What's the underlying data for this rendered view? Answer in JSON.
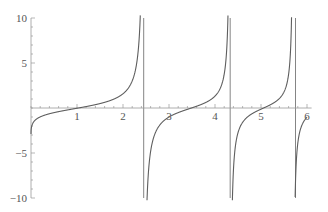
{
  "chart_data": {
    "type": "line",
    "title": "",
    "xlabel": "",
    "ylabel": "",
    "xlim": [
      0,
      6.1
    ],
    "ylim": [
      -10,
      10
    ],
    "grid": false,
    "legend": null,
    "x_ticks": [
      1,
      2,
      3,
      4,
      5,
      6
    ],
    "x_tick_labels": [
      "1",
      "2",
      "3",
      "4",
      "5",
      "6"
    ],
    "y_ticks": [
      -10,
      -5,
      5,
      10
    ],
    "y_tick_labels": [
      "−10",
      "−5",
      "5",
      "10"
    ],
    "x_minor_per_major": 4,
    "y_minor_per_major": 4,
    "series": [
      {
        "name": "f(x)",
        "style": "line",
        "color": "#5e5e5e",
        "description": "tangent-like periodic curve with increasing frequency",
        "vertical_asymptotes": [
          2.45,
          4.33,
          5.75
        ],
        "zero_crossings": [
          1.4,
          3.45,
          5.0
        ],
        "points": [
          [
            0.0,
            -2.9
          ],
          [
            0.1,
            -2.3
          ],
          [
            0.25,
            -1.9
          ],
          [
            0.5,
            -1.45
          ],
          [
            0.75,
            -1.1
          ],
          [
            1.0,
            -0.8
          ],
          [
            1.25,
            -0.45
          ],
          [
            1.5,
            0.0
          ],
          [
            1.75,
            0.5
          ],
          [
            2.0,
            1.3
          ],
          [
            2.2,
            2.6
          ],
          [
            2.3,
            4.0
          ],
          [
            2.38,
            6.5
          ],
          [
            2.42,
            10.0
          ],
          [
            2.48,
            -10.0
          ],
          [
            2.6,
            -6.0
          ],
          [
            2.8,
            -3.3
          ],
          [
            3.0,
            -1.9
          ],
          [
            3.2,
            -1.0
          ],
          [
            3.45,
            0.0
          ],
          [
            3.7,
            1.0
          ],
          [
            3.9,
            2.2
          ],
          [
            4.1,
            4.5
          ],
          [
            4.22,
            7.5
          ],
          [
            4.3,
            10.0
          ],
          [
            4.37,
            -10.0
          ],
          [
            4.5,
            -5.0
          ],
          [
            4.7,
            -2.2
          ],
          [
            5.0,
            0.0
          ],
          [
            5.25,
            1.8
          ],
          [
            5.45,
            4.0
          ],
          [
            5.6,
            7.0
          ],
          [
            5.7,
            10.0
          ],
          [
            5.8,
            -10.0
          ],
          [
            5.9,
            -5.5
          ],
          [
            6.0,
            -3.5
          ]
        ]
      }
    ],
    "plot_params": {
      "phase_offset": -1.238,
      "sqrt_coef": 1.006,
      "sq_coef": 0.2057
    }
  }
}
